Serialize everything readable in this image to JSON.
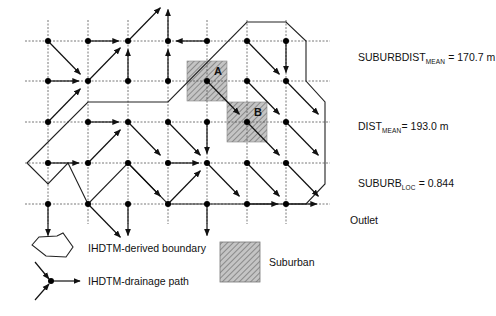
{
  "diagram": {
    "grid": {
      "columns": 7,
      "rows": 5
    },
    "suburban_cells": [
      {
        "label": "A",
        "col": 4,
        "row": 2
      },
      {
        "label": "B",
        "col": 5,
        "row": 3
      }
    ],
    "flow_arrows": [
      {
        "from": [
          0,
          0
        ],
        "dir": "SE"
      },
      {
        "from": [
          1,
          0
        ],
        "dir": "E"
      },
      {
        "from": [
          2,
          0
        ],
        "dir": "NE"
      },
      {
        "from": [
          3,
          0
        ],
        "dir": "N"
      },
      {
        "from": [
          4,
          0
        ],
        "dir": "W"
      },
      {
        "from": [
          5,
          0
        ],
        "dir": "SE"
      },
      {
        "from": [
          6,
          0
        ],
        "dir": "S"
      },
      {
        "from": [
          7,
          0
        ],
        "dir": "S"
      },
      {
        "from": [
          0,
          1
        ],
        "dir": "E"
      },
      {
        "from": [
          1,
          1
        ],
        "dir": "NE"
      },
      {
        "from": [
          2,
          1
        ],
        "dir": "N"
      },
      {
        "from": [
          3,
          1
        ],
        "dir": "N"
      },
      {
        "from": [
          4,
          1
        ],
        "dir": "SE"
      },
      {
        "from": [
          5,
          1
        ],
        "dir": "SE"
      },
      {
        "from": [
          6,
          1
        ],
        "dir": "SE"
      },
      {
        "from": [
          7,
          1
        ],
        "dir": "SE"
      },
      {
        "from": [
          0,
          2
        ],
        "dir": "NE"
      },
      {
        "from": [
          1,
          2
        ],
        "dir": "E"
      },
      {
        "from": [
          2,
          2
        ],
        "dir": "SE"
      },
      {
        "from": [
          3,
          2
        ],
        "dir": "SE"
      },
      {
        "from": [
          4,
          2
        ],
        "dir": "S"
      },
      {
        "from": [
          5,
          2
        ],
        "dir": "SE"
      },
      {
        "from": [
          6,
          2
        ],
        "dir": "SE"
      },
      {
        "from": [
          7,
          2
        ],
        "dir": "S"
      },
      {
        "from": [
          0,
          3
        ],
        "dir": "E"
      },
      {
        "from": [
          1,
          3
        ],
        "dir": "NE"
      },
      {
        "from": [
          2,
          3
        ],
        "dir": "SE"
      },
      {
        "from": [
          3,
          3
        ],
        "dir": "E"
      },
      {
        "from": [
          4,
          3
        ],
        "dir": "SE"
      },
      {
        "from": [
          5,
          3
        ],
        "dir": "SE"
      },
      {
        "from": [
          6,
          3
        ],
        "dir": "SE"
      },
      {
        "from": [
          7,
          3
        ],
        "dir": "S"
      },
      {
        "from": [
          0,
          4
        ],
        "dir": "S"
      },
      {
        "from": [
          1,
          4
        ],
        "dir": "SE"
      },
      {
        "from": [
          2,
          4
        ],
        "dir": "S"
      },
      {
        "from": [
          3,
          4
        ],
        "dir": "NE"
      },
      {
        "from": [
          4,
          4
        ],
        "dir": "S"
      },
      {
        "from": [
          5,
          4
        ],
        "dir": "E"
      },
      {
        "from": [
          6,
          4
        ],
        "dir": "E"
      },
      {
        "from": [
          7,
          4
        ],
        "dir": "SE"
      }
    ],
    "outlet_label": "Outlet"
  },
  "stats": {
    "suburbdist_mean": {
      "name": "SUBURBDIST",
      "sub": "MEAN",
      "value": "= 170.7 m"
    },
    "dist_mean": {
      "name": "DIST",
      "sub": "MEAN",
      "value": "= 193.0 m"
    },
    "suburb_loc": {
      "name": "SUBURB",
      "sub": "LOC",
      "value": "= 0.844"
    }
  },
  "legend": {
    "boundary_label": "IHDTM-derived boundary",
    "drainage_label": "IHDTM-drainage path",
    "suburban_label": "Suburban"
  },
  "colors": {
    "suburban_fill": "#b8b8b8",
    "ink": "#111111"
  }
}
